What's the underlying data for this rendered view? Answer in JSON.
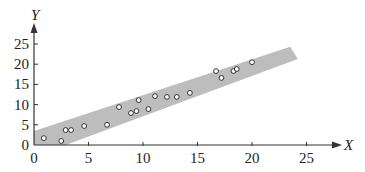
{
  "chart_data": {
    "type": "scatter",
    "title": "",
    "xlabel": "X",
    "ylabel": "Y",
    "xlim": [
      0,
      28
    ],
    "ylim": [
      0,
      28
    ],
    "x_ticks": [
      0,
      5,
      10,
      15,
      20,
      25
    ],
    "y_ticks": [
      0,
      5,
      10,
      15,
      20,
      25
    ],
    "grid": false,
    "legend": null,
    "series": [
      {
        "name": "observations",
        "marker": "open-circle",
        "points": [
          [
            0.9,
            1.7
          ],
          [
            2.5,
            1.0
          ],
          [
            2.9,
            3.7
          ],
          [
            3.4,
            3.7
          ],
          [
            4.6,
            4.7
          ],
          [
            6.7,
            5.0
          ],
          [
            7.8,
            9.4
          ],
          [
            8.9,
            7.9
          ],
          [
            9.4,
            8.4
          ],
          [
            9.6,
            11.1
          ],
          [
            10.5,
            8.9
          ],
          [
            11.1,
            12.1
          ],
          [
            12.2,
            11.9
          ],
          [
            13.1,
            11.9
          ],
          [
            14.3,
            12.9
          ],
          [
            16.7,
            18.3
          ],
          [
            17.2,
            16.6
          ],
          [
            18.3,
            18.3
          ],
          [
            18.6,
            18.8
          ],
          [
            20.0,
            20.5
          ]
        ]
      }
    ],
    "band": {
      "description": "shaded prediction/confidence band around linear trend",
      "color": "#bdbdbd",
      "polygon": [
        [
          0,
          3.5
        ],
        [
          23.5,
          24.3
        ],
        [
          24.2,
          21.3
        ],
        [
          2.9,
          0
        ],
        [
          0,
          0
        ]
      ]
    }
  },
  "axes": {
    "x_label": "X",
    "y_label": "Y",
    "x_tick_labels": [
      "0",
      "5",
      "10",
      "15",
      "20",
      "25"
    ],
    "y_tick_labels": [
      "0",
      "5",
      "10",
      "15",
      "20",
      "25"
    ]
  }
}
